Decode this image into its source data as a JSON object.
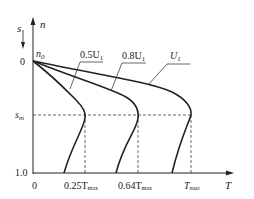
{
  "diagram": {
    "axes": {
      "y_label_n": "n",
      "y_label_s": "s",
      "x_label": "T",
      "origin_label": "0",
      "n0_label": "n",
      "n0_sub": "0",
      "s_zero_label": "0",
      "s_one_label": "1.0",
      "sm_label": "s",
      "sm_sub": "m"
    },
    "curves": [
      {
        "label_main": "0.5U",
        "label_sub": "1",
        "torque_label_main": "0.25T",
        "torque_label_sub": "max"
      },
      {
        "label_main": "0.8U",
        "label_sub": "1",
        "torque_label_main": "0.64T",
        "torque_label_sub": "max"
      },
      {
        "label_main": "U",
        "label_sub": "1",
        "torque_label_main": "T",
        "torque_label_sub": "max"
      }
    ],
    "colors": {
      "line": "#222222",
      "background": "#ffffff"
    }
  }
}
